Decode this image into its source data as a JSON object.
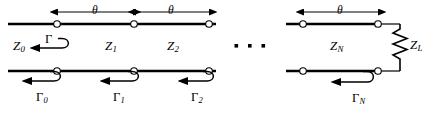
{
  "figure": {
    "kind": "transmission-line-cascade-schematic"
  },
  "colors": {
    "line": "#000000",
    "background": "#ffffff",
    "node_fill": "#ffffff"
  },
  "labels": {
    "theta_1": "θ",
    "theta_2": "θ",
    "theta_N": "θ",
    "z_source": "Z",
    "z_source_sub": "0",
    "z_1": "Z",
    "z_1_sub": "1",
    "z_2": "Z",
    "z_2_sub": "2",
    "z_n": "Z",
    "z_n_sub": "N",
    "z_load": "Z",
    "z_load_sub": "L",
    "gamma_top": "Γ",
    "gamma_0": "Γ",
    "gamma_0_sub": "0",
    "gamma_1": "Γ",
    "gamma_1_sub": "1",
    "gamma_2": "Γ",
    "gamma_2_sub": "2",
    "gamma_n": "Γ",
    "gamma_n_sub": "N",
    "ellipsis": "· · ·"
  },
  "geometry": {
    "top_conductor_y": 24,
    "bottom_conductor_y": 71,
    "dimension_line_y": 12,
    "nodes_left_group_x": [
      57,
      134,
      209
    ],
    "nodes_right_group_x": [
      303,
      378
    ],
    "left_line_start_x": 8,
    "left_line_end_x": 216,
    "right_line_start_x": 286,
    "right_line_end_x": 400,
    "resistor_x": 400,
    "resistor_top_y": 28,
    "resistor_bottom_y": 63
  }
}
